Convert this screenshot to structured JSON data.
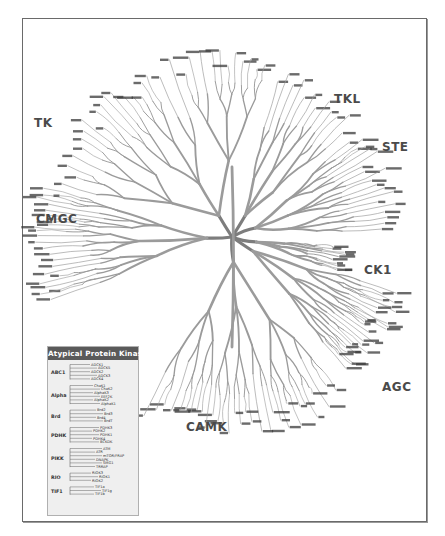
{
  "diagram": {
    "colors": {
      "branch": "#9b9b9b",
      "branch_dark": "#7d7d7d",
      "label_text": "#3a3a3a",
      "group_label": "#4a4a4a",
      "frame": "#6a6a6a",
      "atypical_header_bg": "#5a5a5a",
      "atypical_bg": "#efefef"
    },
    "root": {
      "x": 232,
      "y": 237
    },
    "groups": [
      {
        "id": "TK",
        "label": "TK",
        "x": 34,
        "y": 116,
        "angle_start": 195,
        "angle_end": 282,
        "radius": 190,
        "leaves": 34
      },
      {
        "id": "TKL",
        "label": "TKL",
        "x": 334,
        "y": 92,
        "angle_start": 285,
        "angle_end": 318,
        "radius": 175,
        "leaves": 16
      },
      {
        "id": "STE",
        "label": "STE",
        "x": 382,
        "y": 140,
        "angle_start": 320,
        "angle_end": 358,
        "radius": 170,
        "leaves": 22
      },
      {
        "id": "CK1",
        "label": "CK1",
        "x": 364,
        "y": 263,
        "angle_start": 5,
        "angle_end": 18,
        "radius": 120,
        "leaves": 8
      },
      {
        "id": "AGC",
        "label": "AGC",
        "x": 382,
        "y": 380,
        "angle_start": 18,
        "angle_end": 50,
        "radius": 180,
        "leaves": 24
      },
      {
        "id": "CAMK",
        "label": "CAMK",
        "x": 186,
        "y": 420,
        "angle_start": 55,
        "angle_end": 118,
        "radius": 200,
        "leaves": 30
      },
      {
        "id": "CMGC",
        "label": "CMGC",
        "x": 36,
        "y": 212,
        "angle_start": 160,
        "angle_end": 195,
        "radius": 200,
        "leaves": 26
      }
    ],
    "atypical": {
      "title": "Atypical Protein Kinases",
      "families": [
        {
          "name": "ABC1",
          "members": [
            "ADCK1",
            "ADCK5",
            "ADCK2",
            "ADCK3",
            "ADCK4"
          ]
        },
        {
          "name": "Alpha",
          "members": [
            "ChaK1",
            "ChaK2",
            "AlphaK3",
            "EEF2K",
            "AlphaK2",
            "AlphaK1"
          ]
        },
        {
          "name": "Brd",
          "members": [
            "Brd2",
            "Brd3",
            "Brd4",
            "BrdT"
          ]
        },
        {
          "name": "PDHK",
          "members": [
            "PDHK3",
            "PDHK2",
            "PDHK1",
            "PDHK4",
            "BCKDK"
          ]
        },
        {
          "name": "PIKK",
          "members": [
            "ATM",
            "ATR",
            "mTOR/FRAP",
            "DNAPK",
            "SMG1",
            "TRRAP"
          ]
        },
        {
          "name": "RIO",
          "members": [
            "RIOK3",
            "RIOK1",
            "RIOK2"
          ]
        },
        {
          "name": "TIF1",
          "members": [
            "TIF1a",
            "TIF1g",
            "TIF1b"
          ]
        }
      ]
    }
  }
}
